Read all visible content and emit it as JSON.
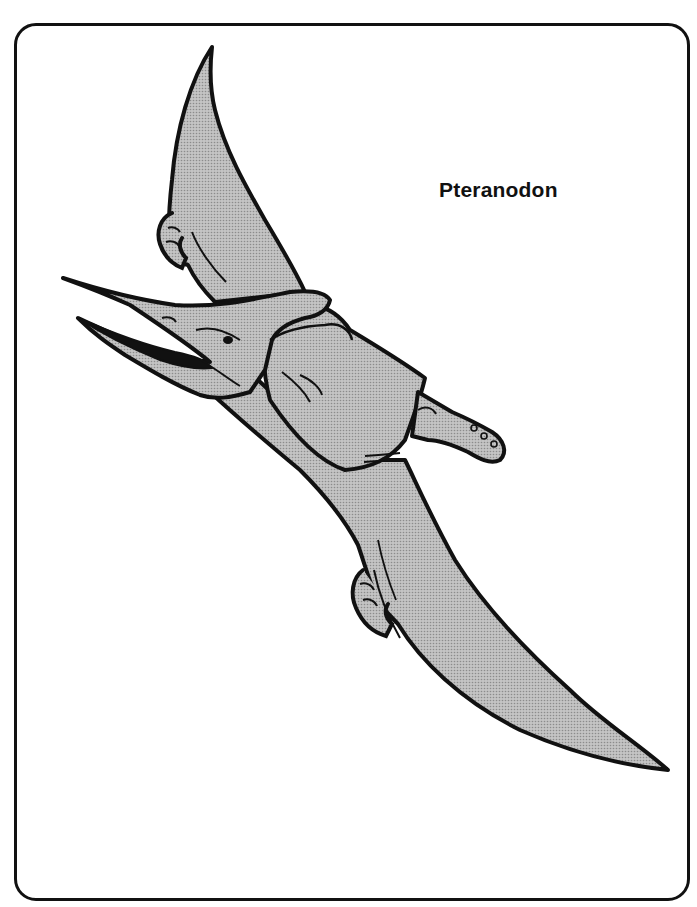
{
  "page": {
    "title": "Pteranodon",
    "style": "coloring-page illustration",
    "colors": {
      "outline": "#111111",
      "fill": "#b9b9b9",
      "background": "#ffffff"
    }
  },
  "illustration": {
    "subject": "Pteranodon in flight",
    "parts": [
      "upper-wing",
      "upper-claw",
      "head-crest",
      "open-beak",
      "eye",
      "neck",
      "body",
      "foot",
      "lower-wing",
      "lower-claw"
    ]
  }
}
